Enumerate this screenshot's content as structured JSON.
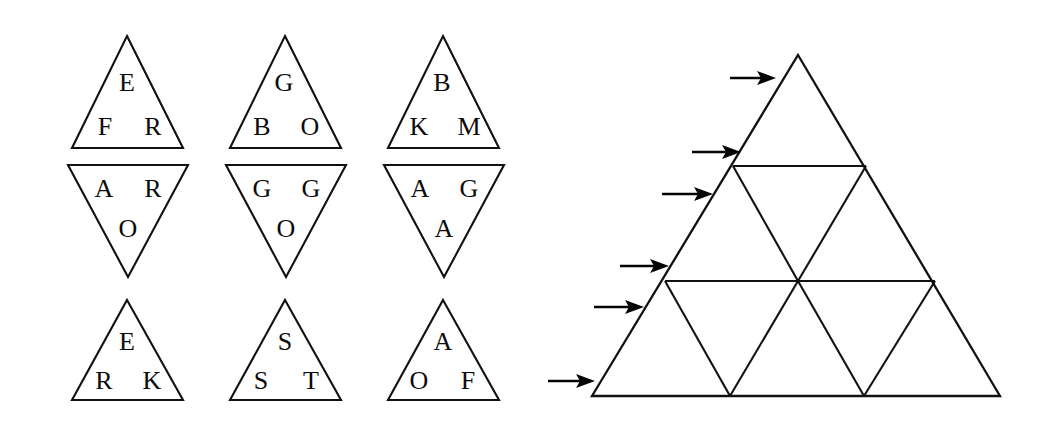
{
  "figure": {
    "background_color": "#ffffff",
    "ink_color": "#111111",
    "letter_color": "#0b0b0b"
  },
  "letter_triangles": {
    "description": "Nine small triangles arranged in three rows of three; rows 1 and 3 point up, row 2 points down.",
    "rows": [
      {
        "row_index": 1,
        "orientation": "up",
        "cells": [
          {
            "id": "tri-1",
            "orientation": "up",
            "top_letter": "E",
            "bottom_left_letter": "F",
            "bottom_right_letter": "R",
            "letters": [
              "E",
              "F",
              "R"
            ],
            "apex": {
              "x": 127,
              "y": 36
            },
            "base_left": {
              "x": 72,
              "y": 148
            },
            "base_right": {
              "x": 183,
              "y": 148
            }
          },
          {
            "id": "tri-2",
            "orientation": "up",
            "top_letter": "G",
            "bottom_left_letter": "B",
            "bottom_right_letter": "O",
            "letters": [
              "G",
              "B",
              "O"
            ],
            "apex": {
              "x": 285,
              "y": 36
            },
            "base_left": {
              "x": 230,
              "y": 148
            },
            "base_right": {
              "x": 341,
              "y": 148
            }
          },
          {
            "id": "tri-3",
            "orientation": "up",
            "top_letter": "B",
            "bottom_left_letter": "K",
            "bottom_right_letter": "M",
            "letters": [
              "B",
              "K",
              "M"
            ],
            "apex": {
              "x": 443,
              "y": 36
            },
            "base_left": {
              "x": 388,
              "y": 148
            },
            "base_right": {
              "x": 499,
              "y": 148
            }
          }
        ]
      },
      {
        "row_index": 2,
        "orientation": "down",
        "cells": [
          {
            "id": "tri-4",
            "orientation": "down",
            "top_left_letter": "A",
            "top_right_letter": "R",
            "bottom_letter": "O",
            "letters": [
              "A",
              "R",
              "O"
            ],
            "top_left": {
              "x": 68,
              "y": 165
            },
            "top_right": {
              "x": 188,
              "y": 165
            },
            "apex": {
              "x": 128,
              "y": 277
            }
          },
          {
            "id": "tri-5",
            "orientation": "down",
            "top_left_letter": "G",
            "top_right_letter": "G",
            "bottom_letter": "O",
            "letters": [
              "G",
              "G",
              "O"
            ],
            "top_left": {
              "x": 226,
              "y": 165
            },
            "top_right": {
              "x": 346,
              "y": 165
            },
            "apex": {
              "x": 286,
              "y": 277
            }
          },
          {
            "id": "tri-6",
            "orientation": "down",
            "top_left_letter": "A",
            "top_right_letter": "G",
            "bottom_letter": "A",
            "letters": [
              "A",
              "G",
              "A"
            ],
            "top_left": {
              "x": 384,
              "y": 165
            },
            "top_right": {
              "x": 504,
              "y": 165
            },
            "apex": {
              "x": 444,
              "y": 277
            }
          }
        ]
      },
      {
        "row_index": 3,
        "orientation": "up",
        "cells": [
          {
            "id": "tri-7",
            "orientation": "up",
            "top_letter": "E",
            "bottom_left_letter": "R",
            "bottom_right_letter": "K",
            "letters": [
              "E",
              "R",
              "K"
            ],
            "apex": {
              "x": 127,
              "y": 300
            },
            "base_left": {
              "x": 72,
              "y": 400
            },
            "base_right": {
              "x": 183,
              "y": 400
            }
          },
          {
            "id": "tri-8",
            "orientation": "up",
            "top_letter": "S",
            "bottom_left_letter": "S",
            "bottom_right_letter": "T",
            "letters": [
              "S",
              "S",
              "T"
            ],
            "apex": {
              "x": 285,
              "y": 300
            },
            "base_left": {
              "x": 230,
              "y": 400
            },
            "base_right": {
              "x": 341,
              "y": 400
            }
          },
          {
            "id": "tri-9",
            "orientation": "up",
            "top_letter": "A",
            "bottom_left_letter": "O",
            "bottom_right_letter": "F",
            "letters": [
              "A",
              "O",
              "F"
            ],
            "apex": {
              "x": 443,
              "y": 300
            },
            "base_left": {
              "x": 388,
              "y": 400
            },
            "base_right": {
              "x": 499,
              "y": 400
            }
          }
        ]
      }
    ]
  },
  "big_triangle": {
    "description": "Large triangle subdivided into three horizontal bands; band 2 has 3 sub-triangles, band 3 has 5 sub-triangles.",
    "apex": {
      "x": 798,
      "y": 55
    },
    "base_left": {
      "x": 592,
      "y": 396
    },
    "base_right": {
      "x": 1000,
      "y": 396
    },
    "horizontal_dividers": [
      {
        "index": 1,
        "y": 166,
        "x_start": 733,
        "x_end": 866
      },
      {
        "index": 2,
        "y": 281,
        "x_start": 665,
        "x_end": 935
      }
    ],
    "internal_edges": [
      {
        "from": {
          "x": 733,
          "y": 166
        },
        "to": {
          "x": 798,
          "y": 281
        }
      },
      {
        "from": {
          "x": 866,
          "y": 166
        },
        "to": {
          "x": 798,
          "y": 281
        }
      },
      {
        "from": {
          "x": 665,
          "y": 281
        },
        "to": {
          "x": 730,
          "y": 396
        }
      },
      {
        "from": {
          "x": 798,
          "y": 281
        },
        "to": {
          "x": 730,
          "y": 396
        }
      },
      {
        "from": {
          "x": 798,
          "y": 281
        },
        "to": {
          "x": 864,
          "y": 396
        }
      },
      {
        "from": {
          "x": 935,
          "y": 281
        },
        "to": {
          "x": 864,
          "y": 396
        }
      }
    ],
    "arrows": [
      {
        "index": 1,
        "label": "arrow-1",
        "tip": {
          "x": 775,
          "y": 78
        },
        "tail": {
          "x": 730,
          "y": 78
        }
      },
      {
        "index": 2,
        "label": "arrow-2",
        "tip": {
          "x": 740,
          "y": 152
        },
        "tail": {
          "x": 692,
          "y": 152
        }
      },
      {
        "index": 3,
        "label": "arrow-3",
        "tip": {
          "x": 712,
          "y": 194
        },
        "tail": {
          "x": 662,
          "y": 194
        }
      },
      {
        "index": 4,
        "label": "arrow-4",
        "tip": {
          "x": 668,
          "y": 266
        },
        "tail": {
          "x": 620,
          "y": 266
        }
      },
      {
        "index": 5,
        "label": "arrow-5",
        "tip": {
          "x": 643,
          "y": 307
        },
        "tail": {
          "x": 594,
          "y": 307
        }
      },
      {
        "index": 6,
        "label": "arrow-6",
        "tip": {
          "x": 594,
          "y": 381
        },
        "tail": {
          "x": 548,
          "y": 381
        }
      }
    ],
    "arrow_count": 6
  }
}
